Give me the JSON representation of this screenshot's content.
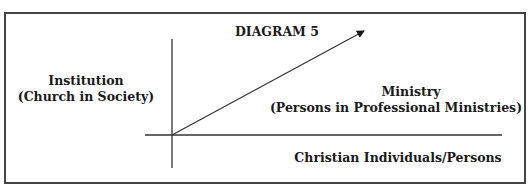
{
  "diagram": {
    "title": "DIAGRAM 5",
    "y_axis_label": {
      "line1": "Institution",
      "line2": "(Church in Society)"
    },
    "vector_label": {
      "line1": "Ministry",
      "line2": "(Persons in Professional Ministries)"
    },
    "x_axis_label": "Christian Individuals/Persons",
    "colors": {
      "ink": "#1a1a1a",
      "border": "#444444",
      "background": "#ffffff"
    }
  }
}
